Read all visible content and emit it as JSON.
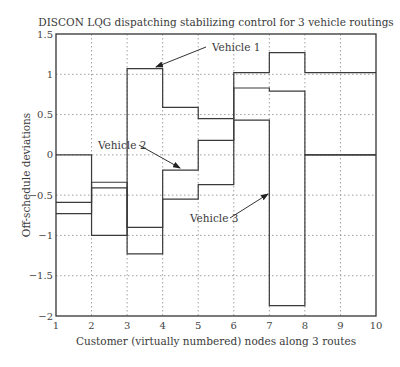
{
  "chart_data": {
    "type": "line",
    "step": true,
    "title": "DISCON LQG dispatching stabilizing control for 3 vehicle routings",
    "xlabel": "Customer (virtually numbered) nodes along 3 routes",
    "ylabel": "Off-schedule deviations",
    "xlim": [
      1,
      10
    ],
    "ylim": [
      -2,
      1.5
    ],
    "xticks": [
      1,
      2,
      3,
      4,
      5,
      6,
      7,
      8,
      9,
      10
    ],
    "yticks": [
      1.5,
      1,
      0.5,
      0,
      -0.5,
      -1,
      -1.5,
      -2
    ],
    "ytick_labels": [
      "1.5",
      "1",
      "0.5",
      "0",
      "−0.5",
      "−1",
      "−1.5",
      "−2"
    ],
    "grid": true,
    "x": [
      1,
      2,
      3,
      4,
      5,
      6,
      7,
      8,
      9,
      10
    ],
    "series": [
      {
        "name": "Vehicle 1",
        "values": [
          0,
          -1.0,
          1.07,
          0.59,
          0.45,
          1.02,
          1.27,
          1.02,
          1.02,
          1.02
        ]
      },
      {
        "name": "Vehicle 2",
        "values": [
          -0.59,
          -0.34,
          -0.9,
          -0.19,
          0.18,
          0.83,
          0.79,
          0,
          0,
          0
        ]
      },
      {
        "name": "Vehicle 3",
        "values": [
          -0.73,
          -0.41,
          -1.23,
          -0.55,
          -0.37,
          0.43,
          -1.87,
          0,
          0,
          0
        ]
      }
    ],
    "annotations": [
      {
        "text": "Vehicle 1",
        "points_to": [
          3.6,
          1.07
        ]
      },
      {
        "text": "Vehicle 2",
        "points_to": [
          4.5,
          -0.19
        ]
      },
      {
        "text": "Vehicle 3",
        "points_to": [
          6.8,
          0.43
        ]
      }
    ]
  }
}
